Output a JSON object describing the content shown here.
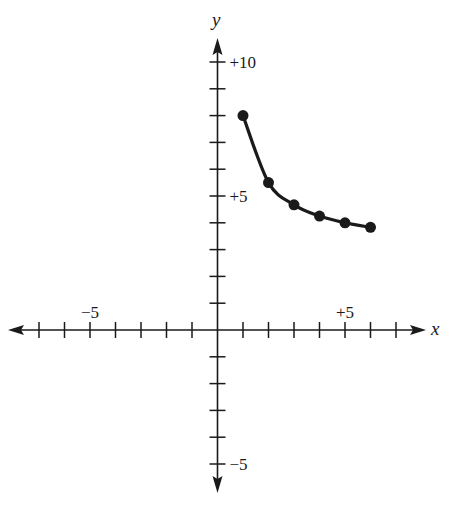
{
  "chart_data": {
    "type": "line",
    "title": "",
    "xlabel": "x",
    "ylabel": "y",
    "xlim": [
      -7,
      7
    ],
    "ylim": [
      -6,
      10
    ],
    "grid": false,
    "legend": null,
    "x_tick_labels": [
      {
        "value": -5,
        "label": "−5"
      },
      {
        "value": 5,
        "label": "+5"
      }
    ],
    "y_tick_labels": [
      {
        "value": 10,
        "label": "+10"
      },
      {
        "value": 5,
        "label": "+5"
      },
      {
        "value": -5,
        "label": "−5"
      }
    ],
    "series": [
      {
        "name": "curve",
        "markers": true,
        "x": [
          1,
          2,
          3,
          4,
          5,
          6
        ],
        "y": [
          8,
          5.5,
          4.67,
          4.25,
          4,
          3.83
        ]
      }
    ]
  },
  "colors": {
    "ink": "#1a1a1a",
    "background": "#ffffff"
  }
}
